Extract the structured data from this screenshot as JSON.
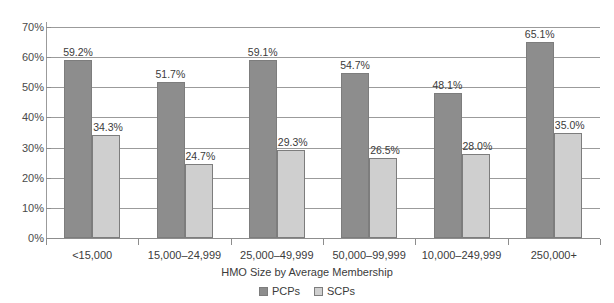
{
  "chart_data": {
    "type": "bar",
    "title": "",
    "xlabel": "HMO Size by Average Membership",
    "ylabel": "",
    "ylim": [
      0,
      70
    ],
    "ytick_step": 10,
    "grid": true,
    "legend_position": "bottom-center",
    "categories": [
      "<15,000",
      "15,000–24,999",
      "25,000–49,999",
      "50,000–99,999",
      "10,000–249,999",
      "250,000+"
    ],
    "ytick_labels": [
      "0%",
      "10%",
      "20%",
      "30%",
      "40%",
      "50%",
      "60%",
      "70%"
    ],
    "series": [
      {
        "name": "PCPs",
        "color": "#8d8d8d",
        "values": [
          59.2,
          51.7,
          59.1,
          54.7,
          48.1,
          65.1
        ],
        "value_labels": [
          "59.2%",
          "51.7%",
          "59.1%",
          "54.7%",
          "48.1%",
          "65.1%"
        ]
      },
      {
        "name": "SCPs",
        "color": "#cfcfcf",
        "values": [
          34.3,
          24.7,
          29.3,
          26.5,
          28.0,
          35.0
        ],
        "value_labels": [
          "34.3%",
          "24.7%",
          "29.3%",
          "26.5%",
          "28.0%",
          "35.0%"
        ]
      }
    ]
  },
  "legend": {
    "items": [
      {
        "label": "PCPs",
        "swatch": "pcp"
      },
      {
        "label": "SCPs",
        "swatch": "scp"
      }
    ]
  }
}
